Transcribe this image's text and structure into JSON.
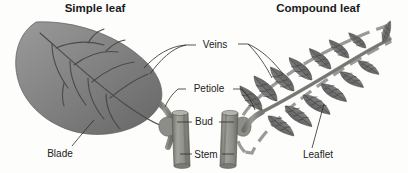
{
  "figure": {
    "background_color": "#fdfdfb",
    "headings": [
      {
        "id": "simple",
        "text": "Simple leaf",
        "x": 95,
        "y": 12
      },
      {
        "id": "compound",
        "text": "Compound leaf",
        "x": 318,
        "y": 12
      }
    ],
    "labels": [
      {
        "id": "veins",
        "text": "Veins",
        "x": 215,
        "y": 48
      },
      {
        "id": "petiole",
        "text": "Petiole",
        "x": 209,
        "y": 92
      },
      {
        "id": "bud",
        "text": "Bud",
        "x": 204,
        "y": 124
      },
      {
        "id": "stem",
        "text": "Stem",
        "x": 206,
        "y": 157
      },
      {
        "id": "blade",
        "text": "Blade",
        "x": 60,
        "y": 155
      },
      {
        "id": "leaflet",
        "text": "Leaflet",
        "x": 318,
        "y": 157
      }
    ],
    "colors": {
      "leaf_fill_light": "#8f8f8f",
      "leaf_fill_dark": "#6a6a6a",
      "leaflet_fill": "#777777",
      "stem_fill": "#8a8a85",
      "outline_dash": "#9a9a9a",
      "leader_line": "#2b2b2b",
      "text": "#1a1a1a"
    },
    "elements": {
      "simple_leaf": "single large ovate blade with pinnate venation",
      "compound_leaf": "rachis bearing many opposite leaflets, enclosed by dashed outline",
      "bud_left": "axillary bud bump on left stem",
      "bud_right": "axillary bud bump on right stem",
      "stem_left": "cylindrical stem segment supporting simple leaf",
      "stem_right": "cylindrical stem segment supporting compound leaf"
    }
  }
}
